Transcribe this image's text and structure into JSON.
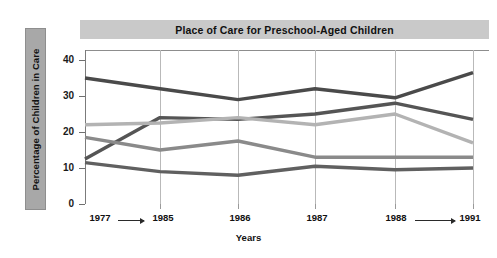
{
  "chart_data": {
    "type": "line",
    "title": "Place of Care for Preschool-Aged Children",
    "xlabel": "Years",
    "ylabel": "Percentage of Children in Care",
    "x": [
      "1977",
      "1985",
      "1986",
      "1987",
      "1988",
      "1991"
    ],
    "xtick_labels": [
      "1977",
      "1985",
      "1986",
      "1987",
      "1988",
      "1991"
    ],
    "ytick_labels": [
      "0",
      "10",
      "20",
      "30",
      "40"
    ],
    "ylim": [
      0,
      43
    ],
    "yticks": [
      0,
      10,
      20,
      30,
      40
    ],
    "grid": "vertical",
    "legend": "none",
    "annotations": [
      "arrow from 1977 to 1985",
      "arrow from 1988 to 1991"
    ],
    "series": [
      {
        "name": "series-1-dark-top",
        "color": "#4a4a4a",
        "values": [
          35,
          32,
          29,
          32,
          29.5,
          36.5
        ]
      },
      {
        "name": "series-2-dark-rising",
        "color": "#555555",
        "values": [
          12.5,
          24,
          23.5,
          25,
          28,
          23.5
        ]
      },
      {
        "name": "series-3-light-gray",
        "color": "#b3b3b3",
        "values": [
          22,
          22.5,
          24,
          22,
          25,
          17
        ]
      },
      {
        "name": "series-4-medium-gray",
        "color": "#8a8a8a",
        "values": [
          18.5,
          15,
          17.5,
          13,
          13,
          13
        ]
      },
      {
        "name": "series-5-bottom-dark",
        "color": "#606060",
        "values": [
          11.5,
          9,
          8,
          10.5,
          9.5,
          10
        ]
      }
    ]
  },
  "colors": {
    "title_band": "#c9c9c9",
    "ylabel_band": "#a8a8a8",
    "gridline": "#b9b9b9",
    "axis": "#7b7b7b",
    "text": "#111111"
  }
}
